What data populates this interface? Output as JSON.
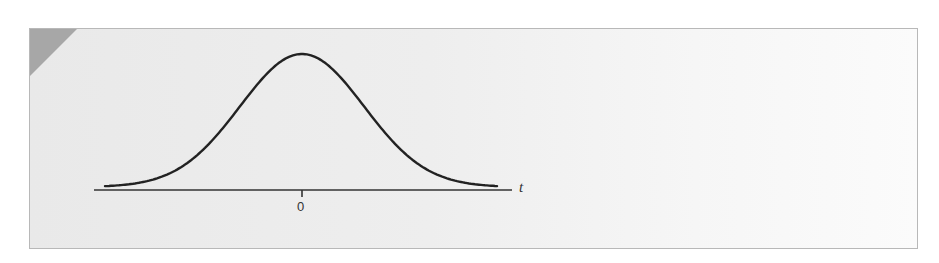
{
  "figure": {
    "axis_label": "t",
    "tick_label": "0",
    "colors": {
      "panel_background": "#eeeeee",
      "corner_accent": "#a7a7a7",
      "curve": "#222222",
      "axis": "#333333"
    }
  },
  "chart_data": {
    "type": "line",
    "title": "",
    "xlabel": "t",
    "ylabel": "",
    "x_ticks": [
      "0"
    ],
    "grid": false,
    "legend": null,
    "series": [
      {
        "name": "density",
        "x": [
          -3,
          -2.5,
          -2,
          -1.5,
          -1,
          -0.5,
          0,
          0.5,
          1,
          1.5,
          2,
          2.5,
          3
        ],
        "y": [
          0.004,
          0.018,
          0.054,
          0.13,
          0.242,
          0.352,
          0.399,
          0.352,
          0.242,
          0.13,
          0.054,
          0.018,
          0.004
        ]
      }
    ]
  }
}
